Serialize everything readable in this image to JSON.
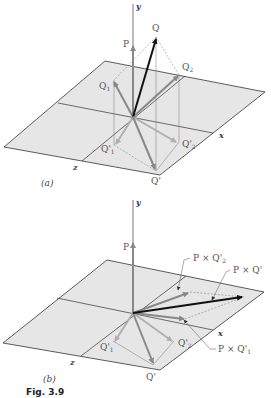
{
  "figure": {
    "caption": "Fig. 3.9",
    "panel_a": {
      "label": "(a)",
      "axes": {
        "y": "y",
        "x": "x",
        "z": "z"
      },
      "vectors": {
        "P": "P",
        "Q": "Q",
        "Q1": "Q",
        "Q1_sub": "1",
        "Q2": "Q",
        "Q2_sub": "2",
        "Qp": "Q'",
        "Q1p": "Q'",
        "Q1p_sub": "1",
        "Q2p": "Q'",
        "Q2p_sub": "2"
      }
    },
    "panel_b": {
      "label": "(b)",
      "axes": {
        "y": "y",
        "x": "x",
        "z": "z"
      },
      "vectors": {
        "P": "P",
        "Qp": "Q'",
        "Q1p": "Q'",
        "Q1p_sub": "1",
        "Q2p": "Q'",
        "Q2p_sub": "2",
        "PxQ2p": "P × Q'",
        "PxQ2p_sub": "2",
        "PxQp": "P × Q'",
        "PxQ1p": "P × Q'",
        "PxQ1p_sub": "1"
      }
    },
    "colors": {
      "plane_fill": "#e6e6e6",
      "plane_edge": "#333333",
      "vector_dark": "#111111",
      "vector_gray": "#888888",
      "vector_light": "#b0b0b0",
      "construction_line": "#777777"
    }
  }
}
